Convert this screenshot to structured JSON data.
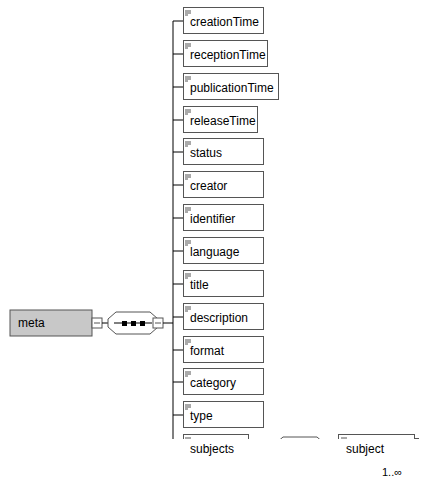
{
  "root": {
    "label": "meta",
    "fill": "#c8c8c8"
  },
  "children": [
    {
      "label": "creationTime",
      "w": 80
    },
    {
      "label": "receptionTime",
      "w": 84
    },
    {
      "label": "publicationTime",
      "w": 95
    },
    {
      "label": "releaseTime",
      "w": 74
    },
    {
      "label": "status",
      "w": 80
    },
    {
      "label": "creator",
      "w": 80
    },
    {
      "label": "identifier",
      "w": 80
    },
    {
      "label": "language",
      "w": 80
    },
    {
      "label": "title",
      "w": 80
    },
    {
      "label": "description",
      "w": 80
    },
    {
      "label": "format",
      "w": 80
    },
    {
      "label": "category",
      "w": 80
    },
    {
      "label": "type",
      "w": 80
    },
    {
      "label": "subjects",
      "w": 65
    }
  ],
  "subject": {
    "label": "subject",
    "cardinality": "1..∞"
  },
  "colors": {
    "line": "#000000",
    "box_border": "#555555"
  }
}
